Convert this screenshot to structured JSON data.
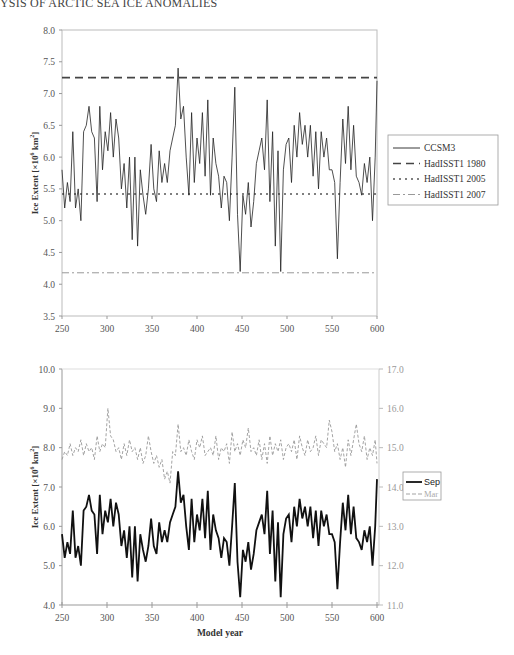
{
  "page": {
    "running_header": "YSIS OF ARCTIC SEA ICE ANOMALIES"
  },
  "chart_data": [
    {
      "type": "line",
      "title": "",
      "xlabel": "",
      "ylabel": "Ice Extent [×10^6 km^2]",
      "xlim": [
        250,
        600
      ],
      "ylim": [
        3.5,
        8.0
      ],
      "x_ticks": [
        "250",
        "300",
        "350",
        "400",
        "450",
        "500",
        "550",
        "600"
      ],
      "y_ticks": [
        "8.0",
        "7.5",
        "7.0",
        "6.5",
        "6.0",
        "5.5",
        "5.0",
        "4.5",
        "4.0",
        "3.5"
      ],
      "grid": false,
      "legend_position": "right",
      "legend": [
        "CCSM3",
        "HadISST1 1980",
        "HadISST1 2005",
        "HadISST1 2007"
      ],
      "series": [
        {
          "name": "CCSM3",
          "style": "solid",
          "x": [
            250,
            253,
            256,
            259,
            262,
            265,
            268,
            271,
            274,
            277,
            280,
            283,
            286,
            289,
            292,
            295,
            298,
            301,
            304,
            307,
            310,
            313,
            316,
            319,
            322,
            325,
            328,
            331,
            334,
            337,
            340,
            343,
            346,
            349,
            352,
            355,
            358,
            361,
            364,
            367,
            370,
            373,
            376,
            379,
            382,
            385,
            388,
            391,
            394,
            397,
            400,
            403,
            406,
            409,
            412,
            415,
            418,
            421,
            424,
            427,
            430,
            433,
            436,
            439,
            442,
            445,
            448,
            451,
            454,
            457,
            460,
            463,
            466,
            469,
            472,
            475,
            478,
            481,
            484,
            487,
            490,
            493,
            496,
            499,
            502,
            505,
            508,
            511,
            514,
            517,
            520,
            523,
            526,
            529,
            532,
            535,
            538,
            541,
            544,
            547,
            550,
            553,
            556,
            559,
            562,
            565,
            568,
            571,
            574,
            577,
            580,
            583,
            586,
            589,
            592,
            595,
            598,
            600
          ],
          "y": [
            5.8,
            5.2,
            5.6,
            5.3,
            6.4,
            5.2,
            5.5,
            5.0,
            6.4,
            6.5,
            6.8,
            6.4,
            6.3,
            5.3,
            6.8,
            5.8,
            6.4,
            6.1,
            6.7,
            6.0,
            6.6,
            6.3,
            5.5,
            5.9,
            5.2,
            6.0,
            4.7,
            6.0,
            4.6,
            5.8,
            5.4,
            5.1,
            5.5,
            6.2,
            5.5,
            5.3,
            6.1,
            5.6,
            5.9,
            5.6,
            6.1,
            6.3,
            6.5,
            7.4,
            6.6,
            6.8,
            6.0,
            5.4,
            6.7,
            5.6,
            6.3,
            5.9,
            6.7,
            5.7,
            6.9,
            5.4,
            6.3,
            5.9,
            5.7,
            5.2,
            5.7,
            5.6,
            5.0,
            6.0,
            7.1,
            5.1,
            4.2,
            5.4,
            5.1,
            5.6,
            4.9,
            5.3,
            5.9,
            6.1,
            6.3,
            5.8,
            6.9,
            5.3,
            6.4,
            4.6,
            6.1,
            4.2,
            5.8,
            6.2,
            6.3,
            5.6,
            6.5,
            6.0,
            6.7,
            6.2,
            6.5,
            6.0,
            6.5,
            5.7,
            6.4,
            5.5,
            6.4,
            6.0,
            6.3,
            5.8,
            5.8,
            5.6,
            4.4,
            5.6,
            6.6,
            5.9,
            6.8,
            5.8,
            6.5,
            5.7,
            5.6,
            5.4,
            5.9,
            5.6,
            6.0,
            5.0,
            6.0,
            7.2
          ],
          "color": "#222222"
        },
        {
          "name": "HadISST1 1980",
          "style": "dashed",
          "constant": 7.25,
          "color": "#444444"
        },
        {
          "name": "HadISST1 2005",
          "style": "dotted",
          "constant": 5.42,
          "color": "#555555"
        },
        {
          "name": "HadISST1 2007",
          "style": "dash-dot",
          "constant": 4.18,
          "color": "#999999"
        }
      ]
    },
    {
      "type": "line",
      "title": "",
      "xlabel": "Model year",
      "ylabel": "Ice Extent [×10^6 km^2]",
      "xlim": [
        250,
        600
      ],
      "ylim": [
        4.0,
        10.0
      ],
      "y2lim": [
        11.0,
        17.0
      ],
      "x_ticks": [
        "250",
        "300",
        "350",
        "400",
        "450",
        "500",
        "550",
        "600"
      ],
      "y_ticks": [
        "10.0",
        "9.0",
        "8.0",
        "7.0",
        "6.0",
        "5.0",
        "4.0"
      ],
      "y2_ticks": [
        "17.0",
        "16.0",
        "15.0",
        "14.0",
        "13.0",
        "12.0",
        "11.0"
      ],
      "grid": false,
      "legend_position": "right",
      "legend": [
        "Sep",
        "Mar"
      ],
      "series": [
        {
          "name": "Sep",
          "axis": "left",
          "style": "solid-bold",
          "x": [
            250,
            253,
            256,
            259,
            262,
            265,
            268,
            271,
            274,
            277,
            280,
            283,
            286,
            289,
            292,
            295,
            298,
            301,
            304,
            307,
            310,
            313,
            316,
            319,
            322,
            325,
            328,
            331,
            334,
            337,
            340,
            343,
            346,
            349,
            352,
            355,
            358,
            361,
            364,
            367,
            370,
            373,
            376,
            379,
            382,
            385,
            388,
            391,
            394,
            397,
            400,
            403,
            406,
            409,
            412,
            415,
            418,
            421,
            424,
            427,
            430,
            433,
            436,
            439,
            442,
            445,
            448,
            451,
            454,
            457,
            460,
            463,
            466,
            469,
            472,
            475,
            478,
            481,
            484,
            487,
            490,
            493,
            496,
            499,
            502,
            505,
            508,
            511,
            514,
            517,
            520,
            523,
            526,
            529,
            532,
            535,
            538,
            541,
            544,
            547,
            550,
            553,
            556,
            559,
            562,
            565,
            568,
            571,
            574,
            577,
            580,
            583,
            586,
            589,
            592,
            595,
            598,
            600
          ],
          "y": [
            5.8,
            5.2,
            5.6,
            5.3,
            6.4,
            5.2,
            5.5,
            5.0,
            6.4,
            6.5,
            6.8,
            6.4,
            6.3,
            5.3,
            6.8,
            5.8,
            6.4,
            6.1,
            6.7,
            6.0,
            6.6,
            6.3,
            5.5,
            5.9,
            5.2,
            6.0,
            4.7,
            6.0,
            4.6,
            5.8,
            5.4,
            5.1,
            5.5,
            6.2,
            5.5,
            5.3,
            6.1,
            5.6,
            5.9,
            5.6,
            6.1,
            6.3,
            6.5,
            7.4,
            6.6,
            6.8,
            6.0,
            5.4,
            6.7,
            5.6,
            6.3,
            5.9,
            6.7,
            5.7,
            6.9,
            5.4,
            6.3,
            5.9,
            5.7,
            5.2,
            5.7,
            5.6,
            5.0,
            6.0,
            7.1,
            5.1,
            4.2,
            5.4,
            5.1,
            5.6,
            4.9,
            5.3,
            5.9,
            6.1,
            6.3,
            5.8,
            6.9,
            5.3,
            6.4,
            4.6,
            6.1,
            4.2,
            5.8,
            6.2,
            6.3,
            5.6,
            6.5,
            6.0,
            6.7,
            6.2,
            6.5,
            6.0,
            6.5,
            5.7,
            6.4,
            5.5,
            6.4,
            6.0,
            6.3,
            5.8,
            5.8,
            5.6,
            4.4,
            5.6,
            6.6,
            5.9,
            6.8,
            5.8,
            6.5,
            5.7,
            5.6,
            5.4,
            5.9,
            5.6,
            6.0,
            5.0,
            6.0,
            7.2
          ],
          "color": "#111111"
        },
        {
          "name": "Mar",
          "axis": "right",
          "style": "dashed",
          "x": [
            250,
            253,
            256,
            259,
            262,
            265,
            268,
            271,
            274,
            277,
            280,
            283,
            286,
            289,
            292,
            295,
            298,
            301,
            304,
            307,
            310,
            313,
            316,
            319,
            322,
            325,
            328,
            331,
            334,
            337,
            340,
            343,
            346,
            349,
            352,
            355,
            358,
            361,
            364,
            367,
            370,
            373,
            376,
            379,
            382,
            385,
            388,
            391,
            394,
            397,
            400,
            403,
            406,
            409,
            412,
            415,
            418,
            421,
            424,
            427,
            430,
            433,
            436,
            439,
            442,
            445,
            448,
            451,
            454,
            457,
            460,
            463,
            466,
            469,
            472,
            475,
            478,
            481,
            484,
            487,
            490,
            493,
            496,
            499,
            502,
            505,
            508,
            511,
            514,
            517,
            520,
            523,
            526,
            529,
            532,
            535,
            538,
            541,
            544,
            547,
            550,
            553,
            556,
            559,
            562,
            565,
            568,
            571,
            574,
            577,
            580,
            583,
            586,
            589,
            592,
            595,
            598,
            600
          ],
          "y": [
            14.7,
            14.9,
            14.8,
            15.1,
            14.8,
            15.0,
            14.9,
            15.2,
            14.8,
            15.1,
            14.9,
            15.0,
            14.7,
            15.3,
            14.9,
            15.1,
            15.0,
            16.0,
            15.3,
            15.2,
            14.9,
            15.0,
            14.7,
            15.1,
            14.8,
            15.2,
            14.9,
            15.0,
            14.7,
            15.0,
            14.6,
            14.8,
            15.3,
            14.9,
            14.6,
            14.8,
            14.5,
            14.7,
            14.2,
            14.4,
            14.1,
            14.9,
            14.8,
            15.6,
            14.9,
            15.0,
            14.8,
            15.2,
            14.9,
            14.7,
            15.2,
            15.0,
            15.3,
            14.8,
            14.9,
            15.0,
            14.8,
            15.3,
            14.7,
            15.0,
            14.9,
            15.1,
            14.6,
            15.4,
            14.9,
            15.1,
            14.8,
            15.2,
            15.0,
            15.5,
            14.9,
            15.0,
            14.8,
            15.2,
            14.7,
            15.1,
            14.6,
            15.3,
            14.8,
            15.1,
            14.9,
            15.2,
            14.7,
            15.0,
            15.1,
            14.9,
            15.2,
            14.7,
            15.3,
            15.0,
            14.8,
            15.2,
            14.9,
            15.0,
            15.3,
            14.8,
            15.2,
            15.1,
            15.0,
            15.7,
            15.4,
            14.9,
            15.1,
            14.7,
            15.0,
            14.5,
            15.2,
            14.8,
            15.2,
            15.6,
            15.1,
            14.9,
            15.3,
            14.7,
            15.0,
            14.8,
            15.2,
            14.6
          ],
          "color": "#999999"
        }
      ]
    }
  ]
}
